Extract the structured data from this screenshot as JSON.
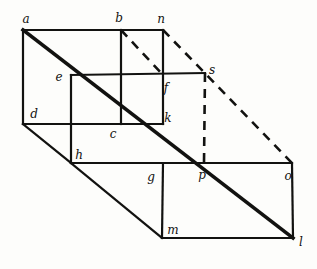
{
  "figure": {
    "style": {
      "background_color": "#fdfdfb",
      "ink_color": "#121210",
      "thin_stroke_width": 2.2,
      "thick_stroke_width": 3.6,
      "dash_stroke_width": 2.6,
      "dash_pattern": "9 7"
    },
    "vertices": [
      {
        "id": "a",
        "label": "a",
        "x": 23,
        "y": 30,
        "label_x": 26,
        "label_y": 19
      },
      {
        "id": "b",
        "label": "b",
        "x": 121,
        "y": 30,
        "label_x": 119,
        "label_y": 18
      },
      {
        "id": "n",
        "label": "n",
        "x": 163,
        "y": 30,
        "label_x": 161,
        "label_y": 19
      },
      {
        "id": "e",
        "label": "e",
        "x": 71,
        "y": 75,
        "label_x": 59,
        "label_y": 77
      },
      {
        "id": "f",
        "label": "f",
        "x": 163,
        "y": 75,
        "label_x": 166,
        "label_y": 88
      },
      {
        "id": "s",
        "label": "s",
        "x": 205,
        "y": 73,
        "label_x": 212,
        "label_y": 70
      },
      {
        "id": "d",
        "label": "d",
        "x": 23,
        "y": 124,
        "label_x": 34,
        "label_y": 114
      },
      {
        "id": "c",
        "label": "c",
        "x": 121,
        "y": 124,
        "label_x": 113,
        "label_y": 134
      },
      {
        "id": "k",
        "label": "k",
        "x": 163,
        "y": 124,
        "label_x": 168,
        "label_y": 118
      },
      {
        "id": "h",
        "label": "h",
        "x": 71,
        "y": 163,
        "label_x": 79,
        "label_y": 155
      },
      {
        "id": "g",
        "label": "g",
        "x": 163,
        "y": 163,
        "label_x": 151,
        "label_y": 177
      },
      {
        "id": "p",
        "label": "p",
        "x": 204,
        "y": 163,
        "label_x": 202,
        "label_y": 175
      },
      {
        "id": "o",
        "label": "o",
        "x": 292,
        "y": 163,
        "label_x": 288,
        "label_y": 176
      },
      {
        "id": "m",
        "label": "m",
        "x": 162,
        "y": 238,
        "label_x": 173,
        "label_y": 230
      },
      {
        "id": "l",
        "label": "l",
        "x": 293,
        "y": 238,
        "label_x": 301,
        "label_y": 242
      }
    ],
    "edges": [
      {
        "name": "edge-a-n",
        "from": "a",
        "to": "n",
        "kind": "solid",
        "weight": "thin"
      },
      {
        "name": "edge-a-d",
        "from": "a",
        "to": "d",
        "kind": "solid",
        "weight": "thin"
      },
      {
        "name": "edge-b-c",
        "from": "b",
        "to": "c",
        "kind": "solid",
        "weight": "thin"
      },
      {
        "name": "edge-n-k",
        "from": "n",
        "to": "k",
        "kind": "solid",
        "weight": "thin"
      },
      {
        "name": "edge-e-s",
        "from": "e",
        "to": "s",
        "kind": "solid",
        "weight": "thin"
      },
      {
        "name": "edge-e-h",
        "from": "e",
        "to": "h",
        "kind": "solid",
        "weight": "thin"
      },
      {
        "name": "edge-d-c-k",
        "from": "d",
        "to": "k",
        "kind": "solid",
        "weight": "thin"
      },
      {
        "name": "edge-h-o",
        "from": "h",
        "to": "o",
        "kind": "solid",
        "weight": "thin"
      },
      {
        "name": "edge-g-m",
        "from": "g",
        "to": "m",
        "kind": "solid",
        "weight": "thin"
      },
      {
        "name": "edge-m-l",
        "from": "m",
        "to": "l",
        "kind": "solid",
        "weight": "thin"
      },
      {
        "name": "edge-o-l",
        "from": "o",
        "to": "l",
        "kind": "solid",
        "weight": "thin"
      },
      {
        "name": "edge-d-h",
        "from": "d",
        "to": "h",
        "kind": "solid",
        "weight": "thin"
      },
      {
        "name": "edge-h-m",
        "from": "h",
        "to": "m",
        "kind": "solid",
        "weight": "thin"
      },
      {
        "name": "diagonal-a-e-c-k-p-l",
        "from": "a",
        "to": "l",
        "kind": "solid",
        "weight": "thick"
      },
      {
        "name": "dashed-b-f",
        "from": "b",
        "to": "f",
        "kind": "dashed",
        "weight": "dash"
      },
      {
        "name": "dashed-n-o",
        "from": "n",
        "to": "o",
        "kind": "dashed",
        "weight": "dash"
      },
      {
        "name": "dashed-s-p",
        "from": "s",
        "to": "p",
        "kind": "dashed",
        "weight": "dash"
      }
    ]
  }
}
